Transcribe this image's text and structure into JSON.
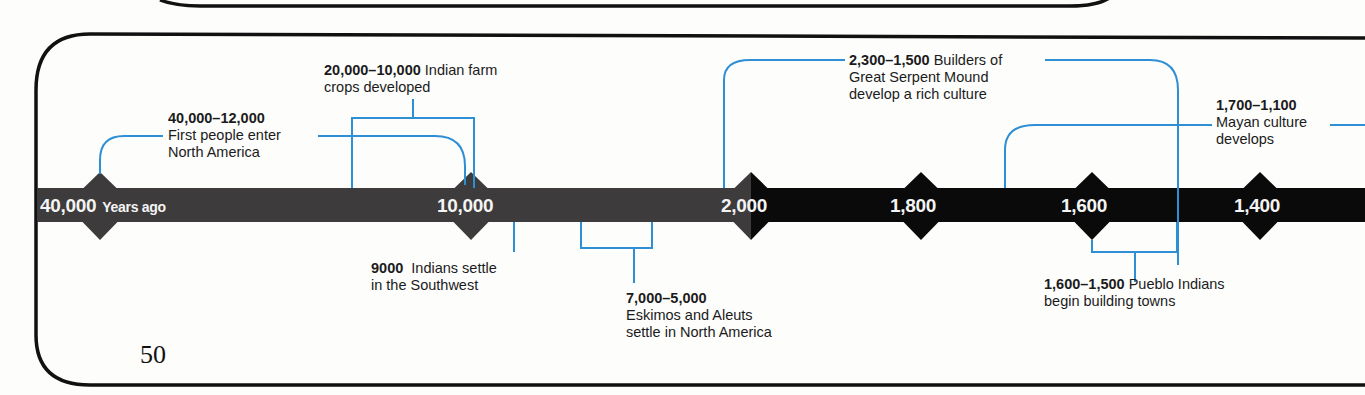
{
  "colors": {
    "border": "#111111",
    "bar_early": "#3d3b3b",
    "bar_late": "#0a0a0a",
    "connector": "#2e8fd4",
    "tick_text": "#f4f4f4"
  },
  "page_number": "50",
  "timeline": {
    "ticks": [
      {
        "value": "40,000",
        "suffix": "Years ago",
        "x": 100
      },
      {
        "value": "10,000",
        "suffix": "",
        "x": 471
      },
      {
        "value": "2,000",
        "suffix": "",
        "x": 751
      },
      {
        "value": "1,800",
        "suffix": "",
        "x": 921
      },
      {
        "value": "1,600",
        "suffix": "",
        "x": 1092
      },
      {
        "value": "1,400",
        "suffix": "",
        "x": 1260
      }
    ],
    "events": [
      {
        "range": "40,000–12,000",
        "text_line1": "First people enter",
        "text_line2": "North America"
      },
      {
        "range": "20,000–10,000",
        "text_line1": "Indian farm",
        "text_line2": "crops developed"
      },
      {
        "range": "9000",
        "text_line1": "Indians settle",
        "text_line2": "in the Southwest"
      },
      {
        "range": "7,000–5,000",
        "text_line1": "Eskimos and Aleuts",
        "text_line2": "settle in North America"
      },
      {
        "range": "2,300–1,500",
        "text_line1": "Builders of",
        "text_line2": "Great Serpent Mound",
        "text_line3": "develop a rich culture"
      },
      {
        "range": "1,700–1,100",
        "text_line1": "Mayan culture",
        "text_line2": "develops"
      },
      {
        "range": "1,600–1,500",
        "text_line1": "Pueblo Indians",
        "text_line2": "begin building towns"
      }
    ]
  }
}
